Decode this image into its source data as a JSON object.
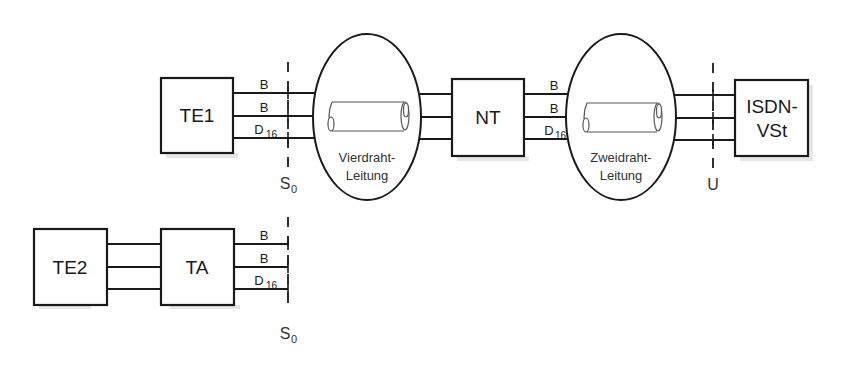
{
  "diagram": {
    "type": "ISDN reference configuration",
    "nodes": {
      "te1": {
        "label": "TE1"
      },
      "nt": {
        "label": "NT"
      },
      "isdn_vst": {
        "label_line1": "ISDN-",
        "label_line2": "VSt"
      },
      "te2": {
        "label": "TE2"
      },
      "ta": {
        "label": "TA"
      }
    },
    "cables": {
      "four_wire": {
        "line1": "Vierdraht-",
        "line2": "Leitung"
      },
      "two_wire": {
        "line1": "Zweidraht-",
        "line2": "Leitung"
      }
    },
    "channels": {
      "b": "B",
      "d": "D",
      "d_sub": "16"
    },
    "interfaces": {
      "s0_upper": {
        "label": "S",
        "sub": "0"
      },
      "u": {
        "label": "U"
      },
      "s0_lower": {
        "label": "S",
        "sub": "0"
      }
    },
    "edges": [
      {
        "from": "TE1",
        "to": "Vierdraht-Leitung",
        "channels": [
          "B",
          "B",
          "D16"
        ],
        "via": "S0"
      },
      {
        "from": "Vierdraht-Leitung",
        "to": "NT",
        "wires": 3
      },
      {
        "from": "NT",
        "to": "Zweidraht-Leitung",
        "channels": [
          "B",
          "B",
          "D16"
        ]
      },
      {
        "from": "Zweidraht-Leitung",
        "to": "ISDN-VSt",
        "wires": 3,
        "via": "U"
      },
      {
        "from": "TE2",
        "to": "TA",
        "wires": 3
      },
      {
        "from": "TA",
        "to": "S0",
        "channels": [
          "B",
          "B",
          "D16"
        ]
      }
    ]
  }
}
